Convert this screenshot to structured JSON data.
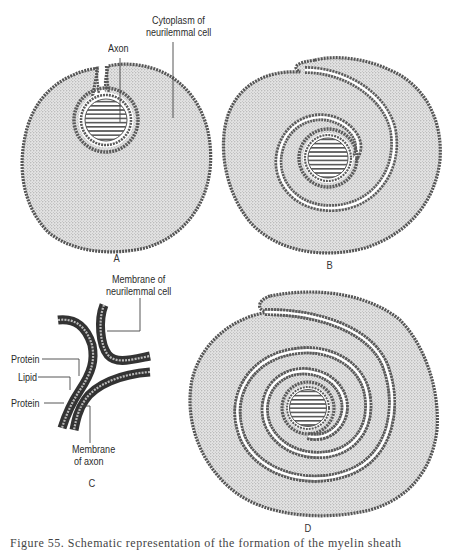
{
  "figure": {
    "caption": "Figure 55.  Schematic representation of the formation of the myelin sheath",
    "panels": [
      {
        "id": "A",
        "letter": "A"
      },
      {
        "id": "B",
        "letter": "B"
      },
      {
        "id": "C",
        "letter": "C"
      },
      {
        "id": "D",
        "letter": "D"
      }
    ],
    "labels": {
      "axon": "Axon",
      "cytoplasm_line1": "Cytoplasm of",
      "cytoplasm_line2": "neurilemmal cell",
      "membrane_neurilemmal_line1": "Membrane of",
      "membrane_neurilemmal_line2": "neurilemmal cell",
      "protein_top": "Protein",
      "lipid": "Lipid",
      "protein_bottom": "Protein",
      "membrane_axon_line1": "Membrane",
      "membrane_axon_line2": "of axon"
    },
    "colors": {
      "cytoplasm_fill": "#d6d6d6",
      "membrane_stroke": "#555555",
      "axon_hatch": "#444444",
      "background": "#ffffff"
    }
  }
}
